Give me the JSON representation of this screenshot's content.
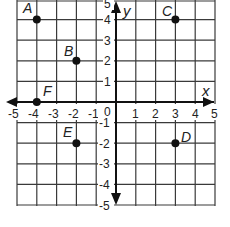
{
  "graph": {
    "x_axis_label": "x",
    "y_axis_label": "y",
    "x_range": [
      -5,
      5
    ],
    "y_range": [
      -5,
      5
    ],
    "x_ticks": [
      "-5",
      "-4",
      "-3",
      "-2",
      "-1",
      "0",
      "1",
      "2",
      "3",
      "4",
      "5"
    ],
    "y_ticks": [
      "5",
      "4",
      "3",
      "2",
      "1",
      "-1",
      "-2",
      "-3",
      "-4",
      "-5"
    ],
    "points": [
      {
        "label": "A",
        "x": -4,
        "y": 4
      },
      {
        "label": "B",
        "x": -2,
        "y": 2
      },
      {
        "label": "C",
        "x": 3,
        "y": 4
      },
      {
        "label": "D",
        "x": 3,
        "y": -2
      },
      {
        "label": "E",
        "x": -2,
        "y": -2
      },
      {
        "label": "F",
        "x": -4,
        "y": 0
      }
    ],
    "colors": {
      "grid": "#3a3a3a",
      "axis": "#111111",
      "point": "#111111",
      "background": "#ffffff"
    }
  }
}
